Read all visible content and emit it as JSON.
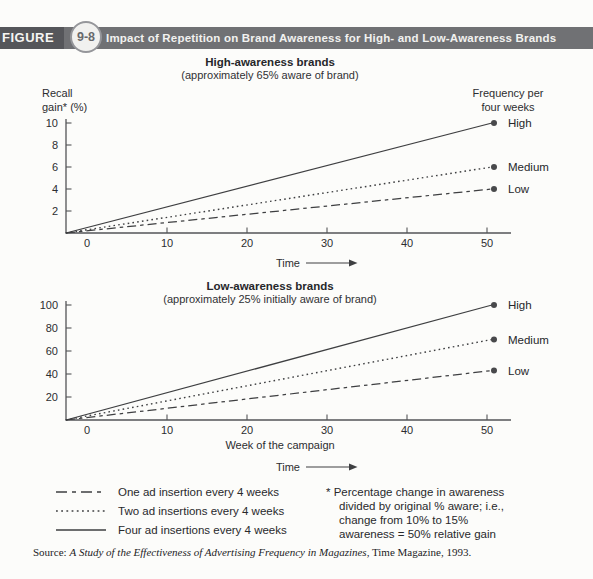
{
  "header": {
    "figure_label": "FIGURE",
    "figure_number": "9-8",
    "title": "Impact of Repetition on Brand Awareness for High- and Low-Awareness Brands"
  },
  "chart_data": [
    {
      "id": "high-awareness",
      "type": "line",
      "title": "High-awareness brands",
      "subtitle": "(approximately 65% aware of brand)",
      "ylabel": "Recall gain* (%)",
      "ylabel_display": "Recall\ngain* (%)",
      "right_header": "Frequency per four weeks",
      "right_header_display": "Frequency per\nfour weeks",
      "xlabel": "",
      "time_label": "Time",
      "xlim": [
        -3,
        53
      ],
      "ylim": [
        0,
        10
      ],
      "xticks": [
        0,
        10,
        20,
        30,
        40,
        50
      ],
      "yticks": [
        2,
        4,
        6,
        8,
        10
      ],
      "grid": false,
      "legend_position": "line-end-right",
      "series": [
        {
          "name": "High",
          "style": "solid",
          "x": [
            0,
            50
          ],
          "values": [
            0,
            10
          ],
          "end_value": 10
        },
        {
          "name": "Medium",
          "style": "dotted",
          "x": [
            0,
            50
          ],
          "values": [
            0,
            6
          ],
          "end_value": 6
        },
        {
          "name": "Low",
          "style": "dashdot",
          "x": [
            0,
            50
          ],
          "values": [
            0,
            4
          ],
          "end_value": 4
        }
      ]
    },
    {
      "id": "low-awareness",
      "type": "line",
      "title": "Low-awareness brands",
      "subtitle": "(approximately 25% initially aware of brand)",
      "ylabel": "",
      "xlabel": "Week of the campaign",
      "time_label": "Time",
      "xlim": [
        -3,
        53
      ],
      "ylim": [
        0,
        100
      ],
      "xticks": [
        0,
        10,
        20,
        30,
        40,
        50
      ],
      "yticks": [
        20,
        40,
        60,
        80,
        100
      ],
      "grid": false,
      "legend_position": "line-end-right",
      "series": [
        {
          "name": "High",
          "style": "solid",
          "x": [
            0,
            50
          ],
          "values": [
            0,
            100
          ],
          "end_value": 100
        },
        {
          "name": "Medium",
          "style": "dotted",
          "x": [
            0,
            50
          ],
          "values": [
            0,
            70
          ],
          "end_value": 70
        },
        {
          "name": "Low",
          "style": "dashdot",
          "x": [
            0,
            50
          ],
          "values": [
            0,
            43
          ],
          "end_value": 43
        }
      ]
    }
  ],
  "legend": {
    "items": [
      {
        "style": "dashdot",
        "label": "One ad insertion every 4 weeks"
      },
      {
        "style": "dotted",
        "label": "Two ad insertions every 4 weeks"
      },
      {
        "style": "solid",
        "label": "Four ad insertions every 4 weeks"
      }
    ]
  },
  "footnote": {
    "lines": [
      "* Percentage change in awareness",
      "divided by original % aware; i.e.,",
      "change from 10% to 15%",
      "awareness = 50% relative gain"
    ]
  },
  "source": {
    "prefix": "Source:",
    "study_title": "A Study of the Effectiveness of Advertising Frequency in Magazines",
    "suffix": ", Time Magazine, 1993."
  },
  "colors": {
    "header_bar": "#707174",
    "figure_box": "#55565a",
    "line_stroke": "#3e3f41",
    "axis_stroke": "#535457",
    "background": "#fcfcfa"
  }
}
